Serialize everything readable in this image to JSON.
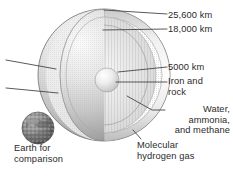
{
  "figure": {
    "background_color": "#ffffff",
    "text_color": "#2b2b2b"
  },
  "labels": {
    "outer_radius": "25,600 km",
    "mantle_boundary": "18,000 km",
    "core_radius": "5000 km",
    "core_composition_line1": "Iron and",
    "core_composition_line2": "rock",
    "mantle_composition_line1": "Water,",
    "mantle_composition_line2": "ammonia,",
    "mantle_composition_line3": "and methane",
    "atmosphere_line1": "Molecular",
    "atmosphere_line2": "hydrogen gas",
    "earth_line1": "Earth for",
    "earth_line2": "comparison"
  },
  "colors": {
    "leader_line": "#3c3c3c",
    "sphere_outer_light": "#f2f2f2",
    "sphere_outer_mid": "#c9c9c9",
    "sphere_outer_dark": "#8f8f8f",
    "cut_face_light": "#fbfbfb",
    "cut_face_mid": "#dedede",
    "core_light": "#fafafa",
    "core_mid": "#d2d2d2",
    "earth_dark": "#585858",
    "earth_mid": "#8d8d8d"
  },
  "geometry": {
    "planet_center_x": 104,
    "planet_center_y": 75,
    "planet_radius": 66,
    "core_center_x": 107,
    "core_center_y": 80,
    "core_radius": 12,
    "earth_center_x": 38,
    "earth_center_y": 128,
    "earth_radius": 16
  }
}
